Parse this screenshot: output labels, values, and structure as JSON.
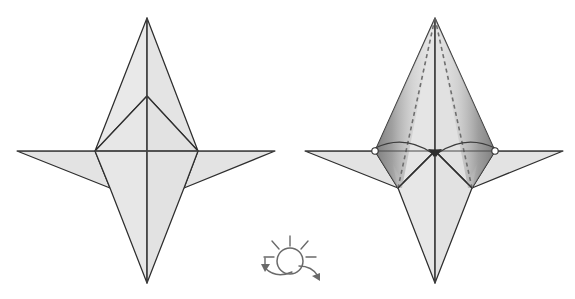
{
  "document": {
    "type": "origami-folding-diagram",
    "title": "Origami step: fold flaps to center and turn over",
    "background_color": "#ffffff",
    "panel_count": 2
  },
  "palette": {
    "paper_light": "#e9e9e9",
    "paper_mid": "#dedede",
    "paper_shadow": "#c9c9c9",
    "paper_dark": "#8e8e8e",
    "outline": "#2e2e2e",
    "crease": "#4a4a4a",
    "dashed_fold": "#6f6f6f",
    "icon": "#6a6a6a"
  },
  "figures": [
    {
      "id": "figure-before",
      "label": "Left figure — model before fold",
      "position": "left",
      "geometry": {
        "apex_top": [
          147,
          18
        ],
        "apex_bottom": [
          147,
          283
        ],
        "point_left": [
          17,
          151
        ],
        "point_right": [
          275,
          151
        ],
        "center": [
          147,
          151
        ],
        "inner_apex": [
          147,
          96
        ],
        "vertex_left": [
          95,
          151
        ],
        "vertex_right": [
          198,
          151
        ],
        "wing_left_low": [
          110,
          188
        ],
        "wing_right_low": [
          184,
          188
        ]
      },
      "elements": [
        "top-spike-left",
        "top-spike-right",
        "inner-triangle-left",
        "inner-triangle-right",
        "left-wing",
        "right-wing",
        "lower-body-left",
        "lower-body-right",
        "vertical-centre-crease",
        "horizontal-centre-crease"
      ]
    },
    {
      "id": "figure-after",
      "label": "Right figure — fold flaps inward to centre, then turn over",
      "position": "right",
      "x_offset": 288,
      "geometry": {
        "apex_top": [
          435,
          18
        ],
        "apex_bottom": [
          435,
          283
        ],
        "point_left": [
          305,
          151
        ],
        "point_right": [
          563,
          151
        ],
        "center": [
          435,
          151
        ],
        "vertex_left": [
          375,
          151
        ],
        "vertex_right": [
          495,
          151
        ],
        "wing_left_low": [
          398,
          188
        ],
        "wing_right_low": [
          472,
          188
        ]
      },
      "fold_lines": [
        {
          "name": "mountain-fold-left",
          "from": [
            435,
            18
          ],
          "to": [
            398,
            188
          ],
          "style": "dashed"
        },
        {
          "name": "mountain-fold-right",
          "from": [
            435,
            18
          ],
          "to": [
            472,
            188
          ],
          "style": "dashed"
        }
      ],
      "shading": [
        {
          "name": "shadow-panel-left",
          "description": "dark gradient band between left outer edge and left dashed fold"
        },
        {
          "name": "shadow-panel-right",
          "description": "dark gradient band between right outer edge and right dashed fold"
        }
      ],
      "motion_arrows": [
        {
          "name": "fold-arrow-left",
          "from": [
            375,
            151
          ],
          "to": [
            435,
            157
          ],
          "direction": "inward-to-centre",
          "style": "curved"
        },
        {
          "name": "fold-arrow-right",
          "from": [
            495,
            151
          ],
          "to": [
            435,
            157
          ],
          "direction": "inward-to-centre",
          "style": "curved"
        }
      ],
      "markers": [
        {
          "name": "pivot-marker-left",
          "at": [
            375,
            151
          ],
          "shape": "small-circle"
        },
        {
          "name": "pivot-marker-right",
          "at": [
            495,
            151
          ],
          "shape": "small-circle"
        }
      ]
    }
  ],
  "icons": {
    "turn_over": {
      "name": "turn-over-icon",
      "meaning": "turn the model over",
      "center": [
        290,
        261
      ],
      "circle_radius": 13,
      "ray_count": 5,
      "arrow_count": 2
    }
  }
}
